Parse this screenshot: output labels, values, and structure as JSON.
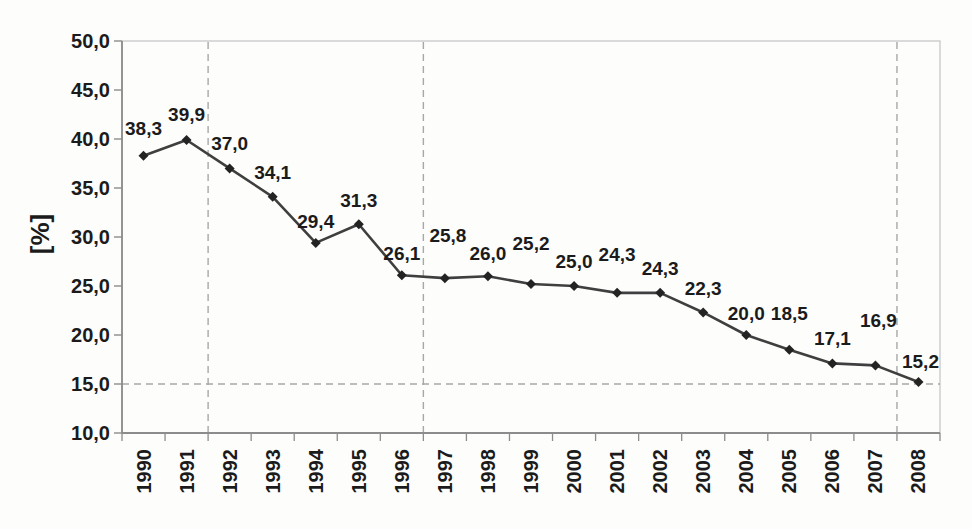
{
  "chart_data": {
    "type": "line",
    "title": "",
    "xlabel": "",
    "ylabel": "[%]",
    "categories": [
      "1990",
      "1991",
      "1992",
      "1993",
      "1994",
      "1995",
      "1996",
      "1997",
      "1998",
      "1999",
      "2000",
      "2001",
      "2002",
      "2003",
      "2004",
      "2005",
      "2006",
      "2007",
      "2008"
    ],
    "values": [
      38.3,
      39.9,
      37.0,
      34.1,
      29.4,
      31.3,
      26.1,
      25.8,
      26.0,
      25.2,
      25.0,
      24.3,
      24.3,
      22.3,
      20.0,
      18.5,
      17.1,
      16.9,
      15.2
    ],
    "point_labels": [
      "38,3",
      "39,9",
      "37,0",
      "34,1",
      "29,4",
      "31,3",
      "26,1",
      "25,8",
      "26,0",
      "25,2",
      "25,0",
      "24,3",
      "24,3",
      "22,3",
      "20,0",
      "18,5",
      "17,1",
      "16,9",
      "15,2"
    ],
    "y_tick_labels": [
      "50,0",
      "45,0",
      "40,0",
      "35,0",
      "30,0",
      "25,0",
      "20,0",
      "15,0",
      "10,0"
    ],
    "ylim": [
      10,
      50
    ],
    "y_step": 5,
    "legend_position": "none",
    "grid": {
      "vertical_dashed_after_categories": [
        "1991",
        "1996",
        "2007"
      ],
      "horizontal_dashed_at_value": 15.0
    },
    "marker": "diamond",
    "colors": {
      "series_line": "#3f3f3f",
      "marker_fill": "#232323",
      "label_text": "#1b1b1b",
      "axis_line": "#8c8c8c",
      "plot_border": "#c3c3c3",
      "dashed_gridline": "#a8a8a8",
      "background": "#fdfdfc"
    }
  }
}
